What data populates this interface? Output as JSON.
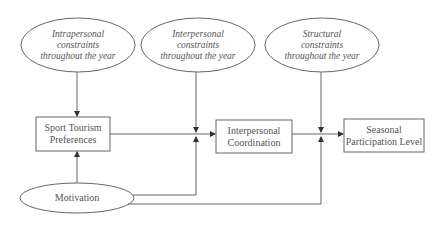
{
  "diagram": {
    "constraints": [
      {
        "id": "intrapersonal",
        "label": "Intrapersonal constraints throughout the year",
        "lines": [
          "Intrapersonal",
          "constraints",
          "throughout the year"
        ]
      },
      {
        "id": "interpersonal",
        "label": "Interpersonal constraints throughout the year",
        "lines": [
          "Interpersonal",
          "constraints",
          "throughout the year"
        ]
      },
      {
        "id": "structural",
        "label": "Structural constraints throughout the year",
        "lines": [
          "Structural",
          "constraints",
          "throughout the year"
        ]
      }
    ],
    "boxes": [
      {
        "id": "preferences",
        "lines": [
          "Sport Tourism",
          "Preferences"
        ]
      },
      {
        "id": "coordination",
        "lines": [
          "Interpersonal",
          "Coordination"
        ]
      },
      {
        "id": "participation",
        "lines": [
          "Seasonal",
          "Participation Level"
        ]
      }
    ],
    "motivation": {
      "label": "Motivation"
    },
    "edges": [
      {
        "from": "Intrapersonal constraints throughout the year",
        "to": "Sport Tourism Preferences"
      },
      {
        "from": "Motivation",
        "to": "Sport Tourism Preferences"
      },
      {
        "from": "Sport Tourism Preferences",
        "to": "Interpersonal Coordination"
      },
      {
        "from": "Interpersonal constraints throughout the year",
        "to": "Sport Tourism Preferences -> Interpersonal Coordination",
        "type": "moderator"
      },
      {
        "from": "Motivation",
        "to": "Sport Tourism Preferences -> Interpersonal Coordination",
        "type": "moderator"
      },
      {
        "from": "Interpersonal Coordination",
        "to": "Seasonal Participation Level"
      },
      {
        "from": "Structural constraints throughout the year",
        "to": "Interpersonal Coordination -> Seasonal Participation Level",
        "type": "moderator"
      },
      {
        "from": "Motivation",
        "to": "Interpersonal Coordination -> Seasonal Participation Level",
        "type": "moderator"
      }
    ]
  },
  "colors": {
    "stroke": "#555555",
    "text": "#555555",
    "background": "#ffffff"
  }
}
